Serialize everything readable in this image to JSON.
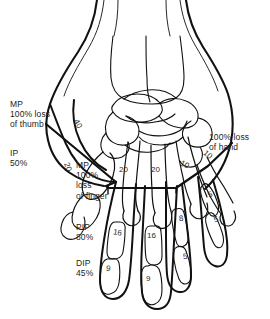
{
  "figure": {
    "background_color": "#ffffff",
    "line_color": "#111111",
    "text_color": "#232323"
  },
  "callouts": [
    {
      "id": "mp-thumb",
      "name": "mp-thumb-label",
      "text": "MP\n100% loss\nof thumb",
      "x": 10,
      "y": 99
    },
    {
      "id": "ip-thumb",
      "name": "ip-thumb-label",
      "text": "IP\n50%",
      "x": 10,
      "y": 148
    },
    {
      "id": "mp-finger",
      "name": "mp-finger-label",
      "text": "MP\n100%\nloss\nof finger",
      "x": 76,
      "y": 160
    },
    {
      "id": "pip-finger",
      "name": "pip-finger-label",
      "text": "PIP\n80%",
      "x": 76,
      "y": 222
    },
    {
      "id": "dip-finger",
      "name": "dip-finger-label",
      "text": "DIP\n45%",
      "x": 76,
      "y": 258
    },
    {
      "id": "whole-hand",
      "name": "whole-hand-label",
      "text": "100% loss\nof hand",
      "x": 209,
      "y": 132
    }
  ],
  "bone_values": [
    {
      "id": "thumb-proximal",
      "name": "value-thumb-proximal",
      "value": "40",
      "x": 73,
      "y": 120,
      "rotate": 62
    },
    {
      "id": "thumb-distal",
      "name": "value-thumb-distal",
      "value": "20",
      "x": 63,
      "y": 163,
      "rotate": 70
    },
    {
      "id": "metacarpal-index",
      "name": "value-metacarpal-index",
      "value": "20",
      "x": 119,
      "y": 166,
      "rotate": 0
    },
    {
      "id": "metacarpal-middle",
      "name": "value-metacarpal-middle",
      "value": "20",
      "x": 151,
      "y": 166,
      "rotate": 0
    },
    {
      "id": "metacarpal-ring",
      "name": "value-metacarpal-ring",
      "value": "10",
      "x": 180,
      "y": 161,
      "rotate": 28
    },
    {
      "id": "metacarpal-little",
      "name": "value-metacarpal-little",
      "value": "10",
      "x": 203,
      "y": 151,
      "rotate": 40
    },
    {
      "id": "index-proximal",
      "name": "value-index-proximal",
      "value": "16",
      "x": 113,
      "y": 229,
      "rotate": 10
    },
    {
      "id": "index-distal",
      "name": "value-index-distal",
      "value": "9",
      "x": 106,
      "y": 265,
      "rotate": 8
    },
    {
      "id": "middle-proximal",
      "name": "value-middle-proximal",
      "value": "16",
      "x": 147,
      "y": 232,
      "rotate": 0
    },
    {
      "id": "middle-distal",
      "name": "value-middle-distal",
      "value": "9",
      "x": 146,
      "y": 275,
      "rotate": 0
    },
    {
      "id": "ring-proximal",
      "name": "value-ring-proximal",
      "value": "8",
      "x": 179,
      "y": 215,
      "rotate": -8
    },
    {
      "id": "ring-distal",
      "name": "value-ring-distal",
      "value": "5",
      "x": 183,
      "y": 253,
      "rotate": -6
    },
    {
      "id": "little-proximal",
      "name": "value-little-proximal",
      "value": "5",
      "x": 208,
      "y": 191,
      "rotate": -22
    },
    {
      "id": "little-distal",
      "name": "value-little-distal",
      "value": "5",
      "x": 214,
      "y": 216,
      "rotate": -18
    }
  ]
}
